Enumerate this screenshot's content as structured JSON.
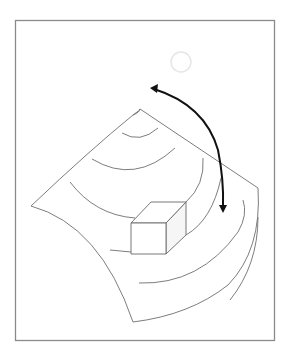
{
  "diagram": {
    "title": "Curved sheet with cube and rotation arrow",
    "colors": {
      "frame": "#8a8a8a",
      "lines": "#6e6e6e",
      "arrow": "#111111",
      "sun": "#e6e6e6",
      "background": "#ffffff"
    },
    "frame": {
      "x": 15,
      "y": 20,
      "width": 259,
      "height": 320
    },
    "sheet": {
      "corners": {
        "top": [
          140,
          109
        ],
        "right": [
          258,
          188
        ],
        "bottom": [
          133,
          322
        ],
        "left": [
          31,
          206
        ]
      }
    },
    "sun": {
      "cx": 181,
      "cy": 62,
      "r": 10
    },
    "rotation_arrow": {
      "start": [
        150,
        88
      ],
      "end": [
        223,
        213
      ],
      "heads": 2
    },
    "cube": {
      "front": [
        [
          131,
          223
        ],
        [
          166,
          223
        ],
        [
          166,
          254
        ],
        [
          131,
          254
        ]
      ],
      "top": [
        [
          131,
          223
        ],
        [
          151,
          202
        ],
        [
          186,
          202
        ],
        [
          166,
          223
        ]
      ],
      "side": [
        [
          166,
          223
        ],
        [
          186,
          202
        ],
        [
          186,
          235
        ],
        [
          166,
          254
        ]
      ]
    },
    "arc_count": 7
  }
}
